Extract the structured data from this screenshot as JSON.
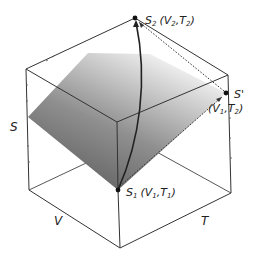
{
  "diagram": {
    "type": "3d-entropy-surface",
    "axes": {
      "s_label": "S",
      "v_label": "V",
      "t_label": "T"
    },
    "points": {
      "s1": {
        "name": "S",
        "sub": "1",
        "coords": "(V",
        "coords_sub1": "1",
        "sep": ",T",
        "coords_sub2": "1",
        "close": ")"
      },
      "s2": {
        "name": "S",
        "sub": "2",
        "coords": "(V",
        "coords_sub1": "2",
        "sep": ",T",
        "coords_sub2": "2",
        "close": ")"
      },
      "sprime": {
        "name": "S'",
        "coords": "(V",
        "coords_sub1": "1",
        "sep": ",T",
        "coords_sub2": "2",
        "close": ")"
      }
    },
    "colors": {
      "edge": "#333333",
      "surface_dark": "#6e6e6e",
      "surface_light": "#f2f2f2",
      "curve": "#222222",
      "dotted": "#333333"
    }
  }
}
